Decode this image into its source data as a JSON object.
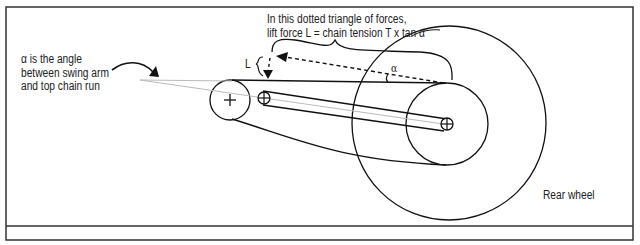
{
  "diagram": {
    "type": "bicycle chain / swing arm force diagram",
    "labels": {
      "alpha_note_line1": "α is the angle",
      "alpha_note_line2": "between swing arm",
      "alpha_note_line3": "and top chain run",
      "triangle_note_line1": "In this dotted triangle of forces,",
      "triangle_note_line2": "lift force L = chain tension T x tan α",
      "lift_label": "L",
      "angle_label": "α",
      "rear_wheel_label": "Rear wheel"
    },
    "colors": {
      "stroke": "#111111",
      "reference_line": "#bbbbbb",
      "background": "#ffffff"
    }
  }
}
